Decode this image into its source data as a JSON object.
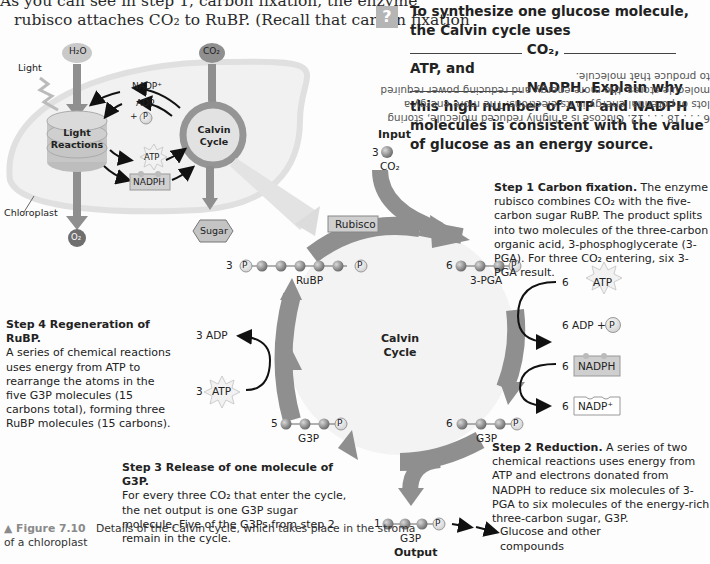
{
  "intro_text": {
    "line1": "As you can see in step 1, carbon fixation, the enzyme",
    "line2": "rubisco attaches CO₂ to RuBP. (Recall that carbon fixation"
  },
  "question": {
    "icon": "question-mark-icon",
    "icon_glyph": "?",
    "part1": "To synthesize one glucose molecule, the Calvin cycle uses",
    "part2": "CO₂,",
    "part3": "ATP, and",
    "part4": "NADPH. Explain why this high number of ATP and NADPH molecules is consistent with the value of glucose as an energy source."
  },
  "answer_upside_down": "6 . . . 18 . . . 12. Glucose is a highly reduced molecule, storing lots of potential energy in its electrons. The more energy a molecule stores, the more energy and reducing power required to produce that molecule.",
  "overview_diagram": {
    "h2o": "H₂O",
    "co2": "CO₂",
    "light": "Light",
    "nadp_plus": "NADP⁺",
    "adp": "ADP",
    "plus": "+",
    "p": "P",
    "atp": "ATP",
    "nadph": "NADPH",
    "light_reactions_l1": "Light",
    "light_reactions_l2": "Reactions",
    "calvin_l1": "Calvin",
    "calvin_l2": "Cycle",
    "chloroplast": "Chloroplast",
    "o2": "O₂",
    "sugar": "Sugar"
  },
  "cycle_diagram": {
    "input_label": "Input",
    "input_count": "3",
    "input_molecule": "CO₂",
    "rubisco": "Rubisco",
    "rubp_count": "3",
    "rubp_label": "RuBP",
    "pga_count": "6",
    "pga_label": "3-PGA",
    "center_l1": "Calvin",
    "center_l2": "Cycle",
    "atp_in_count": "6",
    "atp_in": "ATP",
    "adp_out": "6 ADP +",
    "nadph_count": "6",
    "nadph": "NADPH",
    "nadp_count": "6",
    "nadp": "NADP⁺",
    "g3p6_count": "6",
    "g3p6_label": "G3P",
    "g3p5_count": "5",
    "g3p5_label": "G3P",
    "adp_regen": "3 ADP",
    "atp_regen_count": "3",
    "atp_regen": "ATP",
    "output_count": "1",
    "output_g3p": "G3P",
    "output_label": "Output",
    "glucose_l1": "Glucose and other",
    "glucose_l2": "compounds",
    "p": "P"
  },
  "steps": {
    "step1_title": "Step 1 Carbon fixation.",
    "step1_body": " The enzyme rubisco combines CO₂ with the five-carbon sugar RuBP. The product splits into two molecules of the three-carbon organic acid, 3-phosphoglycerate (3-PGA). For three CO₂ entering, six 3-PGA result.",
    "step2_title": "Step 2 Reduction.",
    "step2_body": " A series of two chemical reactions uses energy from ATP and electrons donated from NADPH to reduce six molecules of 3-PGA to six molecules of the energy-rich three-carbon sugar, G3P.",
    "step3_title": "Step 3 Release of one molecule of G3P.",
    "step3_body": "For every three CO₂ that enter the cycle, the net output is one G3P sugar molecule. Five of the G3Ps from step 2 remain in the cycle.",
    "step4_title": "Step 4 Regeneration of RuBP.",
    "step4_body": "A series of chemical reactions uses energy from ATP to rearrange the atoms in the five G3P molecules (15 carbons total), forming three RuBP molecules (15 carbons)."
  },
  "caption": {
    "figure": "▲ Figure 7.10",
    "text": "Details of the Calvin cycle, which takes place in the stroma of a chloroplast"
  },
  "colors": {
    "arrow_gray": "#8f8f8f",
    "light_gray": "#d4d4d4",
    "ball_gray": "#8a8a8a",
    "figure_label": "#8a8a8a"
  }
}
